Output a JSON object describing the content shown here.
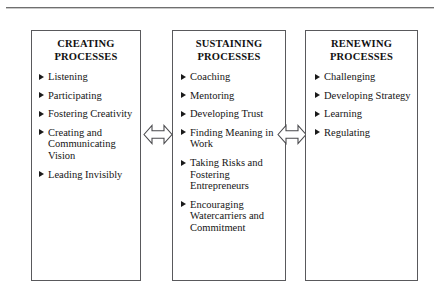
{
  "diagram": {
    "title_line_present": true,
    "boxes": [
      {
        "id": "creating",
        "title_line1": "CREATING",
        "title_line2": "PROCESSES",
        "items": [
          "Listening",
          "Participating",
          "Fostering Creativity",
          "Creating and Communicating Vision",
          "Leading Invisibly"
        ]
      },
      {
        "id": "sustaining",
        "title_line1": "SUSTAINING",
        "title_line2": "PROCESSES",
        "items": [
          "Coaching",
          "Mentoring",
          "Developing Trust",
          "Finding Meaning in Work",
          "Taking Risks and Fostering Entrepreneurs",
          "Encouraging Watercarriers and Commitment"
        ]
      },
      {
        "id": "renewing",
        "title_line1": "RENEWING",
        "title_line2": "PROCESSES",
        "items": [
          "Challenging",
          "Developing Strategy",
          "Learning",
          "Regulating"
        ]
      }
    ],
    "connectors": [
      {
        "id": "creating-to-sustaining",
        "icon": "double-headed-arrow-icon"
      },
      {
        "id": "sustaining-to-renewing",
        "icon": "double-headed-arrow-icon"
      }
    ],
    "colors": {
      "box_border": "#59595c",
      "text": "#151515",
      "bullet": "#1a1a1a",
      "background": "#ffffff",
      "rule": "#6f6f6f"
    }
  }
}
